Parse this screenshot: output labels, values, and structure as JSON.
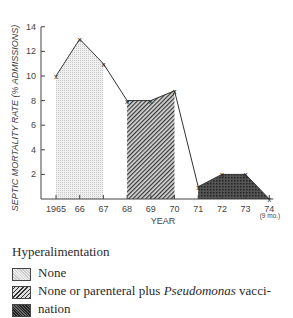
{
  "chart_data": {
    "type": "line",
    "title": "",
    "xlabel": "YEAR",
    "ylabel": "SEPTIC MORTALITY RATE (% ADMISSIONS)",
    "x": [
      "1965",
      "66",
      "67",
      "68",
      "69",
      "70",
      "71",
      "72",
      "73",
      "74"
    ],
    "x_note": "(9 mo.)",
    "values": [
      10,
      13,
      11,
      8,
      8,
      8.8,
      1,
      2,
      2,
      0
    ],
    "ylim": [
      0,
      14
    ],
    "yticks": [
      2,
      4,
      6,
      8,
      10,
      12,
      14
    ],
    "grid": false,
    "marker": "x",
    "shaded_regions": [
      {
        "from": "1965",
        "to": "67",
        "pattern": "light-stipple",
        "legend": "None"
      },
      {
        "from": "68",
        "to": "70",
        "pattern": "diagonal-hatch",
        "legend": "None or parenteral plus Pseudomonas vaccination"
      },
      {
        "from": "71",
        "to": "74",
        "pattern": "dark-crosshatch",
        "legend": "Hyperalimentation (parenteral)"
      }
    ]
  },
  "legend": {
    "title": "Hyperalimentation",
    "items": [
      {
        "label": "None"
      },
      {
        "label_pre": "None or parenteral plus ",
        "label_italic": "Pseudomonas",
        "label_post": " vacci-"
      },
      {
        "label": "nation"
      }
    ]
  }
}
